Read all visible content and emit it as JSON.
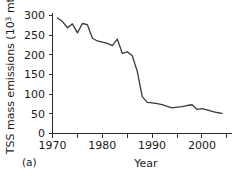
{
  "panel": {
    "label": "(a)"
  },
  "chart_data": {
    "type": "line",
    "title": "",
    "xlabel": "Year",
    "ylabel_main": "TSS mass emissions (10",
    "ylabel_sup": "3",
    "ylabel_tail": " mt)",
    "ylabel_full": "TSS mass emissions (10³ mt)",
    "xlim": [
      1970,
      2006
    ],
    "ylim": [
      0,
      310
    ],
    "grid": false,
    "legend": null,
    "xticks_major": [
      1970,
      1980,
      1990,
      2000
    ],
    "xticks_minor": [
      1975,
      1985,
      1995,
      2005
    ],
    "xtick_labels": [
      "1970",
      "1980",
      "1990",
      "2000"
    ],
    "yticks": [
      0,
      50,
      100,
      150,
      200,
      250,
      300
    ],
    "ytick_labels": [
      "0",
      "50",
      "100",
      "150",
      "200",
      "250",
      "300"
    ],
    "series_name": "TSS mass emissions",
    "line_color": "#3b3b3b",
    "x": [
      1971,
      1972,
      1973,
      1974,
      1975,
      1976,
      1977,
      1978,
      1979,
      1980,
      1981,
      1982,
      1983,
      1984,
      1985,
      1986,
      1987,
      1988,
      1989,
      1990,
      1991,
      1992,
      1993,
      1994,
      1995,
      1996,
      1997,
      1998,
      1999,
      2000,
      2001,
      2002,
      2003,
      2004
    ],
    "values": [
      297,
      288,
      272,
      282,
      259,
      283,
      280,
      245,
      238,
      235,
      232,
      226,
      243,
      206,
      210,
      200,
      160,
      95,
      80,
      79,
      77,
      74,
      70,
      66,
      68,
      69,
      72,
      74,
      62,
      64,
      61,
      57,
      54,
      52
    ]
  }
}
